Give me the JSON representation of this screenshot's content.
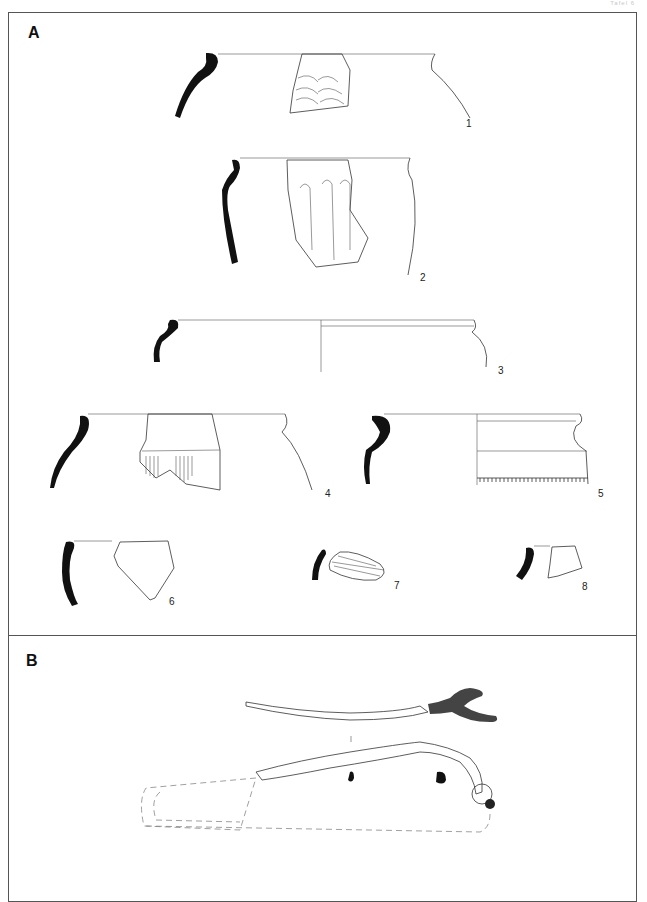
{
  "plate": {
    "header": "Tafel 6",
    "sections": [
      {
        "label": "A",
        "description": "Pottery fragments (profiles and decorated sherds)"
      },
      {
        "label": "B",
        "description": "Metal fibula (brooch), top and side views with dashed reconstruction"
      }
    ],
    "figures": [
      {
        "number": "1",
        "type": "vessel-rim-sherd",
        "decoration": "incised arc rows"
      },
      {
        "number": "2",
        "type": "vessel-rim-sherd",
        "decoration": "vertical fluting"
      },
      {
        "number": "3",
        "type": "vessel-rim-profile",
        "decoration": "none"
      },
      {
        "number": "4",
        "type": "vessel-rim-sherd",
        "decoration": "hatched band"
      },
      {
        "number": "5",
        "type": "vessel-rim-profile",
        "decoration": "comb-impressed band"
      },
      {
        "number": "6",
        "type": "body-sherd",
        "decoration": "stippled"
      },
      {
        "number": "7",
        "type": "body-sherd",
        "decoration": "diagonal grooves"
      },
      {
        "number": "8",
        "type": "rim-sherd",
        "decoration": "stippled band"
      }
    ]
  }
}
